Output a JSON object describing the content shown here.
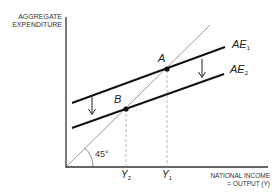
{
  "diagram": {
    "type": "aggregate-expenditure-diagram",
    "y_axis_label_line1": "AGGREGATE",
    "y_axis_label_line2": "EXPENDITURE",
    "x_axis_label_line1": "NATIONAL INCOME",
    "x_axis_label_line2": "= OUTPUT (Y)",
    "angle_label": "45°",
    "curves": [
      {
        "name": "AE",
        "subscript": "1"
      },
      {
        "name": "AE",
        "subscript": "2"
      }
    ],
    "points": [
      {
        "label": "A"
      },
      {
        "label": "B"
      }
    ],
    "x_ticks": [
      {
        "name": "Y",
        "subscript": "2"
      },
      {
        "name": "Y",
        "subscript": "1"
      }
    ],
    "shift_direction": "down"
  }
}
